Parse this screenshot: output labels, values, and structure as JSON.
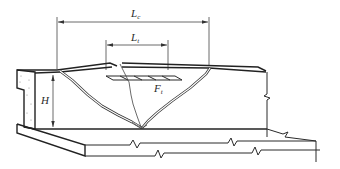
{
  "diagram": {
    "type": "technical line drawing",
    "labels": {
      "crack_length": {
        "main": "L",
        "sub": "c"
      },
      "tension_length": {
        "main": "L",
        "sub": "t"
      },
      "tension_force": {
        "main": "F",
        "sub": "t"
      },
      "height": {
        "main": "H"
      }
    },
    "colors": {
      "line": "#2a2a2a",
      "background": "#ffffff"
    }
  }
}
